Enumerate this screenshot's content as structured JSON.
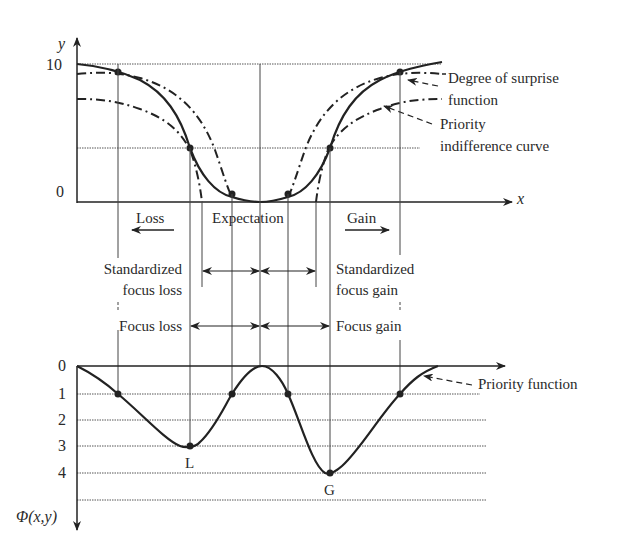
{
  "upper_plot": {
    "y_axis_label": "y",
    "x_axis_label": "x",
    "y_ticks": [
      "10",
      "0"
    ],
    "region_labels": {
      "loss": "Loss",
      "expectation": "Expectation",
      "gain": "Gain"
    },
    "annotations": {
      "surprise_line1": "Degree of surprise",
      "surprise_line2": "function",
      "priority_line1": "Priority",
      "priority_line2": "indifference curve"
    }
  },
  "middle": {
    "std_loss_line1": "Standardized",
    "std_loss_line2": "focus loss",
    "std_gain_line1": "Standardized",
    "std_gain_line2": "focus gain",
    "focus_loss": "Focus loss",
    "focus_gain": "Focus gain"
  },
  "lower_plot": {
    "y_axis_label": "Φ(x,y)",
    "y_ticks": [
      "0",
      "1",
      "2",
      "3",
      "4"
    ],
    "point_L": "L",
    "point_G": "G",
    "annotation": "Priority function"
  },
  "colors": {
    "ink": "#222222",
    "grid": "#555555"
  }
}
